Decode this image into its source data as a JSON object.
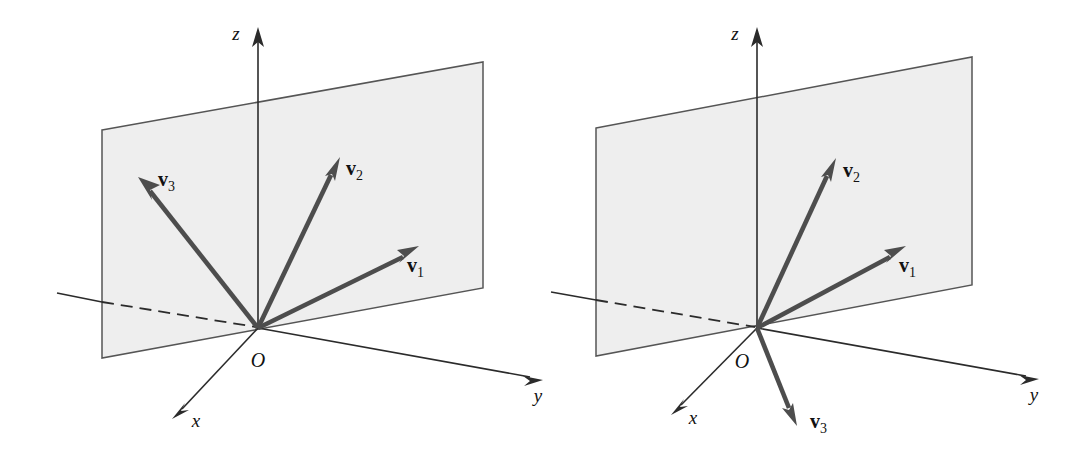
{
  "figure": {
    "background_color": "#ffffff",
    "plane_fill_color": "#eeeeee",
    "plane_stroke_color": "#555555",
    "axis_color": "#2b2b2b",
    "vector_color": "#4d4d4d",
    "panel_count": 2
  },
  "panels": [
    {
      "id": "left-panel",
      "caption": "Left diagram: v1, v2, v3 all lie in the shaded plane",
      "axes": {
        "x_label": "x",
        "y_label": "y",
        "z_label": "z",
        "origin_label": "O"
      },
      "plane": {
        "name": "shaded-plane",
        "fill": "#eeeeee"
      },
      "vectors": [
        {
          "id": "v1",
          "name": "v",
          "subscript": "1",
          "label": "v1",
          "in_plane": true,
          "direction": "up-right"
        },
        {
          "id": "v2",
          "name": "v",
          "subscript": "2",
          "label": "v2",
          "in_plane": true,
          "direction": "up"
        },
        {
          "id": "v3",
          "name": "v",
          "subscript": "3",
          "label": "v3",
          "in_plane": true,
          "direction": "up-left"
        }
      ]
    },
    {
      "id": "right-panel",
      "caption": "Right diagram: v1 and v2 lie in the plane, v3 points out of the plane downward toward the viewer",
      "axes": {
        "x_label": "x",
        "y_label": "y",
        "z_label": "z",
        "origin_label": "O"
      },
      "plane": {
        "name": "shaded-plane",
        "fill": "#eeeeee"
      },
      "vectors": [
        {
          "id": "v1",
          "name": "v",
          "subscript": "1",
          "label": "v1",
          "in_plane": true,
          "direction": "up-right"
        },
        {
          "id": "v2",
          "name": "v",
          "subscript": "2",
          "label": "v2",
          "in_plane": true,
          "direction": "up"
        },
        {
          "id": "v3",
          "name": "v",
          "subscript": "3",
          "label": "v3",
          "in_plane": false,
          "direction": "down-right-front"
        }
      ]
    }
  ]
}
